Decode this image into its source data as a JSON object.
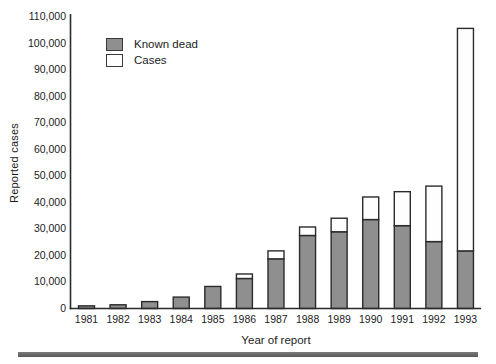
{
  "figure": {
    "background": "#ffffff",
    "text_color": "#1c1c1c",
    "footer_rule_color": "#6e6e6e"
  },
  "legend": {
    "items": [
      {
        "label": "Known dead",
        "swatch_color": "#8f8f8f"
      },
      {
        "label": "Cases",
        "swatch_color": "#fefefe"
      }
    ]
  },
  "chart_data": {
    "type": "bar",
    "stacked": true,
    "title": "",
    "xlabel": "Year of report",
    "ylabel": "Reported cases",
    "categories": [
      "1981",
      "1982",
      "1983",
      "1984",
      "1985",
      "1986",
      "1987",
      "1988",
      "1989",
      "1990",
      "1991",
      "1992",
      "1993"
    ],
    "series": [
      {
        "name": "Known dead",
        "color": "#8f8f8f",
        "values": [
          1000,
          1400,
          2600,
          4300,
          8300,
          11300,
          18700,
          27500,
          28900,
          33500,
          31200,
          25200,
          21700
        ]
      },
      {
        "name": "Cases",
        "color": "#fefefe",
        "values": [
          0,
          0,
          0,
          0,
          0,
          1700,
          3000,
          3200,
          5100,
          8500,
          12800,
          20900,
          83800
        ]
      }
    ],
    "bar_totals": [
      1000,
      1400,
      2600,
      4300,
      8300,
      13000,
      21700,
      30700,
      34000,
      42000,
      44000,
      46100,
      105500
    ],
    "ylim": [
      0,
      110000
    ],
    "ytick_step": 10000,
    "ytick_labels": [
      "0",
      "10,000",
      "20,000",
      "30,000",
      "40,000",
      "50,000",
      "60,000",
      "70,000",
      "80,000",
      "90,000",
      "100,000",
      "110,000"
    ],
    "grid": false,
    "legend_position": "upper left inside plot",
    "axis_color": "#2b2b2b",
    "bar_border_color": "#2b2b2b"
  }
}
